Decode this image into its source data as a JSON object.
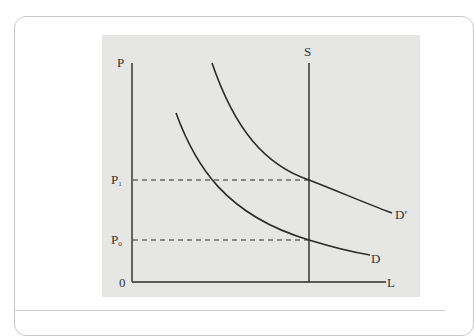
{
  "diagram": {
    "type": "supply-demand",
    "title": "",
    "axes": {
      "y_label": "P",
      "x_label": "L",
      "origin_label": "0"
    },
    "price_levels": [
      {
        "id": "p1",
        "label": "P",
        "subscript": "1"
      },
      {
        "id": "p0",
        "label": "P",
        "subscript": "0"
      }
    ],
    "curves": {
      "supply": {
        "label": "S",
        "kind": "vertical"
      },
      "demand": {
        "label": "D",
        "kind": "downward-sloping"
      },
      "demand_shifted": {
        "label": "D′",
        "kind": "downward-sloping"
      }
    },
    "colors": {
      "panel_background": "#e6e6e4",
      "line": "#2a2a2a",
      "text": "#333333",
      "card_border": "#c8c8c8"
    }
  }
}
